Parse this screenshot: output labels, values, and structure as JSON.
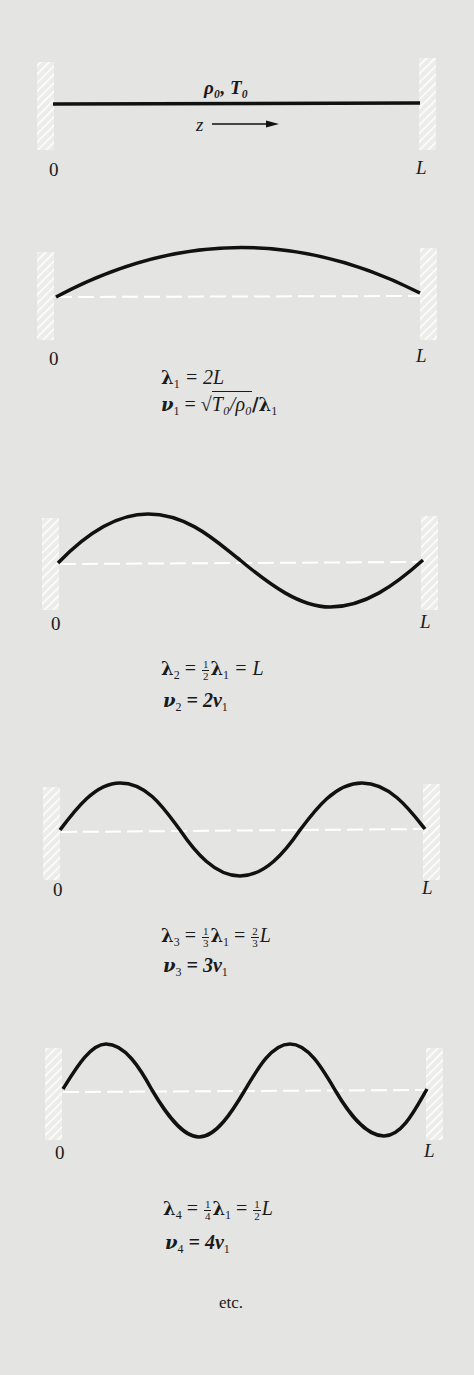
{
  "figure": {
    "colors": {
      "background": "#e4e4e2",
      "string": "#111111",
      "wall_hatch": "#ffffff",
      "equilibrium_dash": "#ffffff",
      "text": "#1a1a1a"
    },
    "panel0": {
      "params_label": "ρ₀, T₀",
      "axis_label": "z",
      "axis_arrow": "arrow-right",
      "left_end": "0",
      "right_end": "L"
    },
    "modes": [
      {
        "n": 1,
        "left_end": "0",
        "right_end": "L",
        "wavelength": {
          "lhs": "λ",
          "sub": "1",
          "rhs": "= 2L"
        },
        "frequency": {
          "lhs": "ν",
          "sub": "1",
          "eq": "=",
          "sqrt_content": "T₀/ρ₀",
          "tail": "/λ",
          "tail_sub": "1"
        }
      },
      {
        "n": 2,
        "left_end": "0",
        "right_end": "L",
        "wavelength": {
          "lhs": "λ",
          "sub": "2",
          "eq": "=",
          "frac_num": "1",
          "frac_den": "2",
          "mid": "λ",
          "mid_sub": "1",
          "rhs": "= L"
        },
        "frequency": {
          "lhs": "ν",
          "sub": "2",
          "rhs": "= 2ν",
          "rhs_sub": "1"
        }
      },
      {
        "n": 3,
        "left_end": "0",
        "right_end": "L",
        "wavelength": {
          "lhs": "λ",
          "sub": "3",
          "eq": "=",
          "frac_num": "1",
          "frac_den": "3",
          "mid": "λ",
          "mid_sub": "1",
          "eq2": "=",
          "frac2_num": "2",
          "frac2_den": "3",
          "rhs": "L"
        },
        "frequency": {
          "lhs": "ν",
          "sub": "3",
          "rhs": "= 3ν",
          "rhs_sub": "1"
        }
      },
      {
        "n": 4,
        "left_end": "0",
        "right_end": "L",
        "wavelength": {
          "lhs": "λ",
          "sub": "4",
          "eq": "=",
          "frac_num": "1",
          "frac_den": "4",
          "mid": "λ",
          "mid_sub": "1",
          "eq2": "=",
          "frac2_num": "1",
          "frac2_den": "2",
          "rhs": "L"
        },
        "frequency": {
          "lhs": "ν",
          "sub": "4",
          "rhs": "= 4ν",
          "rhs_sub": "1"
        }
      }
    ],
    "footer": "etc."
  }
}
